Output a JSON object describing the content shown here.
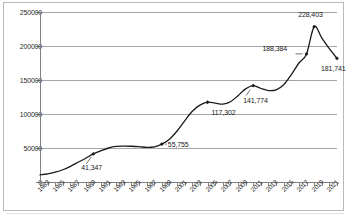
{
  "chart_data": {
    "type": "line",
    "title": "",
    "subtitle": "",
    "xlabel": "",
    "ylabel": "",
    "ylim": [
      0,
      250000
    ],
    "xlim": [
      1983,
      2022
    ],
    "grid": true,
    "legend": false,
    "legend_position": "none",
    "series_name": "",
    "line_color": "#1a1a1a",
    "marker": "diamond",
    "y_ticks": [
      0,
      50000,
      100000,
      150000,
      200000,
      250000
    ],
    "y_tick_labels": [
      "0",
      "50000",
      "100000",
      "150000",
      "200000",
      "250000"
    ],
    "x_tick_labels": [
      "1983",
      "1985",
      "1987",
      "1989",
      "1991",
      "1993",
      "1995",
      "1997",
      "1999",
      "2001",
      "2003",
      "2005",
      "2007",
      "2009",
      "2011",
      "2013",
      "2015",
      "2017",
      "2019",
      "2021"
    ],
    "x": [
      1983,
      1984,
      1985,
      1986,
      1987,
      1988,
      1989,
      1990,
      1991,
      1992,
      1993,
      1994,
      1995,
      1996,
      1997,
      1998,
      1999,
      2000,
      2001,
      2002,
      2003,
      2004,
      2005,
      2006,
      2007,
      2008,
      2009,
      2010,
      2011,
      2012,
      2013,
      2014,
      2015,
      2016,
      2017,
      2018,
      2019,
      2020,
      2021,
      2022
    ],
    "values": [
      10500,
      12000,
      14500,
      18000,
      23000,
      29000,
      35000,
      41347,
      46000,
      50000,
      52300,
      52800,
      52600,
      52000,
      50800,
      51500,
      55755,
      63000,
      75000,
      90000,
      104000,
      113000,
      117302,
      116000,
      114500,
      118000,
      127000,
      137000,
      141774,
      137500,
      134500,
      135500,
      143000,
      158000,
      175000,
      188384,
      228403,
      212000,
      196000,
      181741
    ],
    "annotations": [
      {
        "label": "41,347",
        "year": 1990,
        "value": 41347
      },
      {
        "label": "55,755",
        "year": 1999,
        "value": 55755
      },
      {
        "label": "117,302",
        "year": 2005,
        "value": 117302
      },
      {
        "label": "141,774",
        "year": 2011,
        "value": 141774
      },
      {
        "label": "188,384",
        "year": 2018,
        "value": 188384
      },
      {
        "label": "228,403",
        "year": 2019,
        "value": 228403
      },
      {
        "label": "181,741",
        "year": 2022,
        "value": 181741
      }
    ]
  }
}
